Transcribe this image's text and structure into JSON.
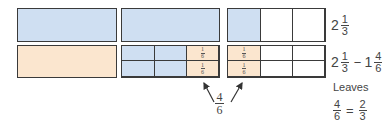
{
  "colors": {
    "shaded_blue": "#cfdff2",
    "shaded_peach": "#fbe6cf",
    "border": "#3a3a3a"
  },
  "rows": [
    {
      "id": "row-original",
      "label": {
        "whole": "2",
        "num": "1",
        "den": "3"
      }
    },
    {
      "id": "row-subtract",
      "label": {
        "whole1": "2",
        "num1": "1",
        "den1": "3",
        "op": "−",
        "whole2": "1",
        "num2": "4",
        "den2": "6"
      }
    }
  ],
  "cell_fraction": {
    "num": "1",
    "den": "6"
  },
  "arrow_label": {
    "num": "4",
    "den": "6"
  },
  "result": {
    "text": "Leaves",
    "lhs_num": "4",
    "lhs_den": "6",
    "eq": "=",
    "rhs_num": "2",
    "rhs_den": "3"
  }
}
